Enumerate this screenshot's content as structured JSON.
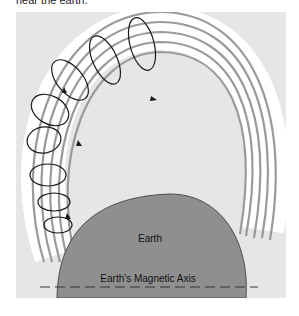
{
  "caption": "near the earth.",
  "diagram": {
    "earth_label": "Earth",
    "axis_label": "Earth's Magnetic Axis",
    "colors": {
      "panel": "#e6e6e6",
      "earth": "#8f8f8f",
      "field_band": "#ffffff",
      "field_lines": "#9a9a9a",
      "helix": "#1a1a1a"
    }
  }
}
